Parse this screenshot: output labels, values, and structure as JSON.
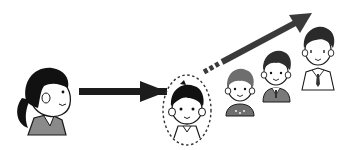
{
  "illustration": {
    "description": "Mentoring / growth concept: a woman points toward a child in a dashed circle, who progresses through older boys to a young man in a suit",
    "colors": {
      "ink": "#1a1a1a",
      "hair": "#111111",
      "skin": "#ffffff",
      "arrow": "#1c1c1c",
      "trend_arrow": "#3a3a3a",
      "clothing_gray": "#8a8a8a",
      "clothing_dark": "#6e6e6e",
      "background": "#ffffff"
    },
    "figures": [
      {
        "id": "woman",
        "label": "Woman (mentor)"
      },
      {
        "id": "child",
        "label": "Child highlighted in dashed circle"
      },
      {
        "id": "boy-small",
        "label": "Young boy"
      },
      {
        "id": "boy-older",
        "label": "Older boy in school uniform"
      },
      {
        "id": "young-man",
        "label": "Young man in suit and tie"
      }
    ],
    "arrows": [
      {
        "id": "guide-arrow",
        "from": "woman",
        "to": "child"
      },
      {
        "id": "growth-arrow",
        "from": "child",
        "to": "top-right",
        "style": "dashed tail"
      }
    ]
  }
}
